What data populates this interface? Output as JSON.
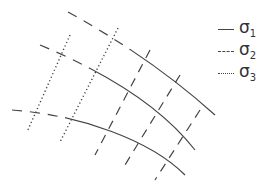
{
  "diagram": {
    "title": "",
    "stroke_color": "#444444",
    "families": [
      {
        "name": "sigma1",
        "style": "solid",
        "curves": [
          "M 68 12 C 110 35, 165 70, 215 115",
          "M 40 45 C 100 70, 160 105, 195 150",
          "M 12 110 C 80 115, 150 140, 185 175"
        ],
        "dashed_prefix_end_x": [
          130,
          90,
          65
        ]
      },
      {
        "name": "sigma2",
        "style": "dashed",
        "lines": [
          "M 150 50 L 95 155",
          "M 180 75 L 125 165",
          "M 200 110 L 155 180"
        ]
      },
      {
        "name": "sigma3",
        "style": "dotted",
        "lines": [
          "M 70 35 L 27 132",
          "M 118 28 L 60 142"
        ]
      }
    ]
  },
  "legend": {
    "items": [
      {
        "style": "solid",
        "symbol": "σ",
        "subscript": "1"
      },
      {
        "style": "dashed",
        "symbol": "σ",
        "subscript": "2"
      },
      {
        "style": "dotted",
        "symbol": "σ",
        "subscript": "3"
      }
    ]
  }
}
